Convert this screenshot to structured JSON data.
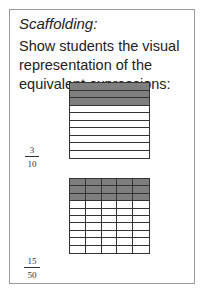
{
  "card": {
    "title": "Scaffolding:",
    "body": "Show students the visual representation of the equivalent expressions:"
  },
  "models": [
    {
      "numerator": "3",
      "denominator": "10",
      "rows": 10,
      "cols": 1,
      "shaded_rows": 3,
      "shade_color": "#7e7e7e"
    },
    {
      "numerator": "15",
      "denominator": "50",
      "rows": 10,
      "cols": 5,
      "shaded_rows": 3,
      "shade_color": "#7e7e7e"
    }
  ]
}
